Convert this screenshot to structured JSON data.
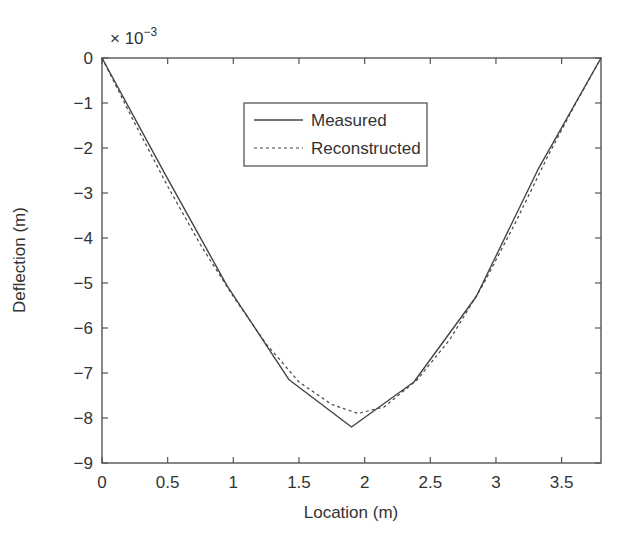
{
  "chart_data": {
    "type": "line",
    "title": "",
    "xlabel": "Location (m)",
    "ylabel": "Deflection (m)",
    "y_multiplier_label": "× 10",
    "y_multiplier_exponent": "−3",
    "xlim": [
      0,
      3.8
    ],
    "ylim": [
      -9,
      0
    ],
    "y_scale": 0.001,
    "grid": false,
    "legend_position": "upper center",
    "xticks": [
      0,
      0.5,
      1,
      1.5,
      2,
      2.5,
      3,
      3.5
    ],
    "xtick_labels": [
      "0",
      "0.5",
      "1",
      "1.5",
      "2",
      "2.5",
      "3",
      "3.5"
    ],
    "yticks": [
      0,
      -1,
      -2,
      -3,
      -4,
      -5,
      -6,
      -7,
      -8,
      -9
    ],
    "ytick_labels": [
      "0",
      "−1",
      "−2",
      "−3",
      "−4",
      "−5",
      "−6",
      "−7",
      "−8",
      "−9"
    ],
    "series": [
      {
        "name": "Measured",
        "style": "solid",
        "color": "#444444",
        "x": [
          0,
          0.475,
          0.95,
          1.425,
          1.9,
          2.375,
          2.85,
          3.325,
          3.8
        ],
        "y": [
          0,
          -2.55,
          -5.05,
          -7.15,
          -8.2,
          -7.2,
          -5.3,
          -2.45,
          0
        ]
      },
      {
        "name": "Reconstructed",
        "style": "dashed",
        "color": "#444444",
        "x": [
          0,
          0.25,
          0.5,
          0.75,
          1.0,
          1.25,
          1.5,
          1.75,
          1.95,
          2.15,
          2.4,
          2.65,
          2.9,
          3.15,
          3.4,
          3.6,
          3.8
        ],
        "y": [
          0,
          -1.45,
          -2.85,
          -4.15,
          -5.3,
          -6.35,
          -7.2,
          -7.7,
          -7.9,
          -7.75,
          -7.15,
          -6.25,
          -5.05,
          -3.65,
          -2.15,
          -1.05,
          0
        ]
      }
    ]
  },
  "legend": {
    "items": [
      {
        "label": "Measured",
        "style": "solid"
      },
      {
        "label": "Reconstructed",
        "style": "dashed"
      }
    ]
  }
}
